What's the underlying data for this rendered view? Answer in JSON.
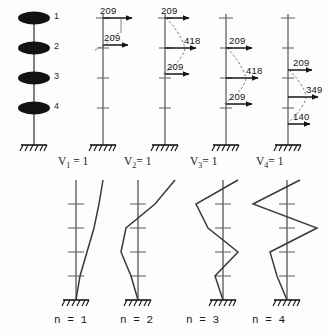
{
  "figure": {
    "type": "structural-diagram",
    "background_color": "#fdfdfd",
    "ink_color": "#1a1a1a",
    "mass_color": "#111111"
  },
  "model": {
    "name": "lumped-mass-cantilever",
    "storeys": 4,
    "mass_labels": [
      "1",
      "2",
      "3",
      "4"
    ],
    "support": "fixed-base-hatched"
  },
  "force_panels": [
    {
      "id": "mode-1",
      "base_shear_label": "V",
      "base_shear_sub": "1",
      "base_shear_value": "1",
      "caption": "V₁ = 1",
      "forces": [
        {
          "floor": 1,
          "value": "209",
          "direction": "right"
        },
        {
          "floor": 2,
          "value": "209",
          "direction": "right"
        }
      ]
    },
    {
      "id": "mode-2",
      "base_shear_label": "V",
      "base_shear_sub": "2",
      "base_shear_value": "1",
      "caption": "V₂ = 1",
      "forces": [
        {
          "floor": 1,
          "value": "209",
          "direction": "right"
        },
        {
          "floor": 2,
          "value": "418",
          "direction": "right"
        },
        {
          "floor": 3,
          "value": "209",
          "direction": "right"
        }
      ]
    },
    {
      "id": "mode-3",
      "base_shear_label": "V",
      "base_shear_sub": "3",
      "base_shear_value": "1",
      "caption": "V₃ = 1",
      "forces": [
        {
          "floor": 2,
          "value": "209",
          "direction": "right"
        },
        {
          "floor": 3,
          "value": "418",
          "direction": "right"
        },
        {
          "floor": 4,
          "value": "209",
          "direction": "right"
        }
      ]
    },
    {
      "id": "mode-4",
      "base_shear_label": "V",
      "base_shear_sub": "4",
      "base_shear_value": "1",
      "caption": "V₄ = 1",
      "forces": [
        {
          "floor": 2,
          "value": "209",
          "direction": "right"
        },
        {
          "floor": 3,
          "value": "349",
          "direction": "right"
        },
        {
          "floor": 4,
          "value": "140",
          "direction": "right"
        }
      ]
    }
  ],
  "shape_panels": [
    {
      "id": "shape-1",
      "caption": "n = 1",
      "n": "1",
      "ordinates": [
        1.0,
        0.72,
        0.42,
        0.17,
        0.0
      ],
      "reversals": 0
    },
    {
      "id": "shape-2",
      "caption": "n = 2",
      "n": "2",
      "ordinates": [
        1.0,
        0.42,
        -0.28,
        -0.44,
        0.0
      ],
      "reversals": 1
    },
    {
      "id": "shape-3",
      "caption": "n = 3",
      "n": "3",
      "ordinates": [
        0.62,
        -0.78,
        -0.4,
        0.56,
        0.0
      ],
      "reversals": 2
    },
    {
      "id": "shape-4",
      "caption": "n = 4",
      "n": "4",
      "ordinates": [
        0.58,
        -0.74,
        0.82,
        -0.44,
        0.0
      ],
      "reversals": 3
    }
  ],
  "captions": {
    "v1": "V",
    "v1_sub": "1",
    "v1_eq": "= 1",
    "v2": "V",
    "v2_sub": "2",
    "v2_eq": "= 1",
    "v3": "V",
    "v3_sub": "3",
    "v3_eq": "= 1",
    "v4": "V",
    "v4_sub": "4",
    "v4_eq": "= 1",
    "n1": "n = 1",
    "n2": "n = 2",
    "n3": "n = 3",
    "n4": "n = 4"
  },
  "mass_numbers": {
    "m1": "1",
    "m2": "2",
    "m3": "3",
    "m4": "4"
  },
  "force_values": {
    "p1_f1": "209",
    "p1_f2": "209",
    "p2_f1": "209",
    "p2_f2": "418",
    "p2_f3": "209",
    "p3_f1": "209",
    "p3_f2": "418",
    "p3_f3": "209",
    "p4_f1": "209",
    "p4_f2": "349",
    "p4_f3": "140"
  }
}
